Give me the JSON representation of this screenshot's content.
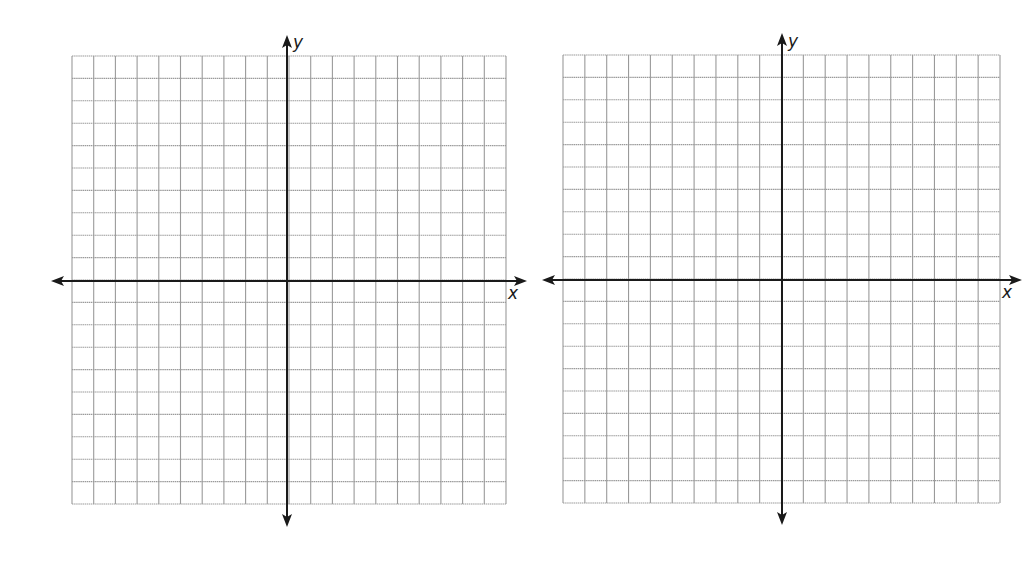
{
  "chart_data": [
    {
      "type": "coordinate-grid",
      "title": "",
      "xlabel": "x",
      "ylabel": "y",
      "columns": 20,
      "rows": 20,
      "x_range_cells": [
        -10,
        10
      ],
      "y_range_cells": [
        -10,
        10
      ],
      "grid": true,
      "tick_labels": [],
      "data_points": []
    },
    {
      "type": "coordinate-grid",
      "title": "",
      "xlabel": "x",
      "ylabel": "y",
      "columns": 20,
      "rows": 20,
      "x_range_cells": [
        -10,
        10
      ],
      "y_range_cells": [
        -10,
        10
      ],
      "grid": true,
      "tick_labels": [],
      "data_points": []
    }
  ],
  "colors": {
    "grid_line": "#9a9a9a",
    "axis_line": "#1a1a1a",
    "background": "#ffffff"
  },
  "planes": [
    {
      "id": "left",
      "grid": {
        "left": 72,
        "top": 56,
        "right": 506,
        "bottom": 504,
        "cols": 20,
        "rows": 20
      },
      "axes": {
        "y_axis_x": 287,
        "x_axis_y": 281,
        "x_arrow_left": 51,
        "x_arrow_right": 527,
        "y_arrow_top": 35,
        "y_arrow_bottom": 527
      },
      "labels": {
        "x": {
          "text": "x",
          "left": 508,
          "top": 285
        },
        "y": {
          "text": "y",
          "left": 293,
          "top": 34
        }
      }
    },
    {
      "id": "right",
      "grid": {
        "left": 563,
        "top": 55,
        "right": 1000,
        "bottom": 503,
        "cols": 20,
        "rows": 20
      },
      "axes": {
        "y_axis_x": 782,
        "x_axis_y": 280,
        "x_arrow_left": 542,
        "x_arrow_right": 1022,
        "y_arrow_top": 33,
        "y_arrow_bottom": 525
      },
      "labels": {
        "x": {
          "text": "x",
          "left": 1002,
          "top": 284
        },
        "y": {
          "text": "y",
          "left": 788,
          "top": 33
        }
      }
    }
  ]
}
